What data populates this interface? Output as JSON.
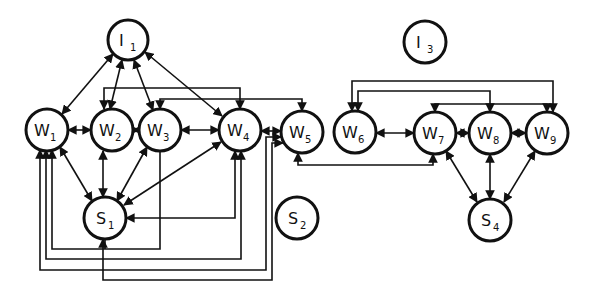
{
  "diagram": {
    "title": "",
    "colors": {
      "stroke": "#111111",
      "background": "#ffffff"
    },
    "nodes": [
      {
        "id": "I1",
        "letter": "I",
        "sub": "1",
        "x": 128,
        "y": 40,
        "r": 20
      },
      {
        "id": "W1",
        "letter": "W",
        "sub": "1",
        "x": 47,
        "y": 130,
        "r": 21
      },
      {
        "id": "W2",
        "letter": "W",
        "sub": "2",
        "x": 112,
        "y": 130,
        "r": 21
      },
      {
        "id": "W3",
        "letter": "W",
        "sub": "3",
        "x": 160,
        "y": 130,
        "r": 21
      },
      {
        "id": "W4",
        "letter": "W",
        "sub": "4",
        "x": 240,
        "y": 130,
        "r": 21
      },
      {
        "id": "W5",
        "letter": "W",
        "sub": "5",
        "x": 302,
        "y": 132,
        "r": 21
      },
      {
        "id": "S1",
        "letter": "S",
        "sub": "1",
        "x": 105,
        "y": 218,
        "r": 21
      },
      {
        "id": "S2",
        "letter": "S",
        "sub": "2",
        "x": 297,
        "y": 218,
        "r": 21
      },
      {
        "id": "I3",
        "letter": "I",
        "sub": "3",
        "x": 425,
        "y": 42,
        "r": 21
      },
      {
        "id": "W6",
        "letter": "W",
        "sub": "6",
        "x": 355,
        "y": 132,
        "r": 21
      },
      {
        "id": "W7",
        "letter": "W",
        "sub": "7",
        "x": 435,
        "y": 133,
        "r": 21
      },
      {
        "id": "W8",
        "letter": "W",
        "sub": "8",
        "x": 490,
        "y": 133,
        "r": 21
      },
      {
        "id": "W9",
        "letter": "W",
        "sub": "9",
        "x": 547,
        "y": 133,
        "r": 21
      },
      {
        "id": "S4",
        "letter": "S",
        "sub": "4",
        "x": 490,
        "y": 220,
        "r": 21
      }
    ],
    "edges": [
      {
        "from": "I1",
        "to": "W1",
        "type": "bidirectional"
      },
      {
        "from": "I1",
        "to": "W2",
        "type": "bidirectional"
      },
      {
        "from": "I1",
        "to": "W3",
        "type": "bidirectional"
      },
      {
        "from": "I1",
        "to": "W4",
        "type": "bidirectional"
      },
      {
        "from": "W1",
        "to": "W2",
        "type": "bidirectional"
      },
      {
        "from": "W2",
        "to": "W3",
        "type": "bidirectional"
      },
      {
        "from": "W3",
        "to": "W4",
        "type": "bidirectional"
      },
      {
        "from": "W4",
        "to": "W5",
        "type": "bidirectional"
      },
      {
        "from": "W1",
        "to": "S1",
        "type": "bidirectional"
      },
      {
        "from": "W2",
        "to": "S1",
        "type": "bidirectional"
      },
      {
        "from": "W3",
        "to": "S1",
        "type": "bidirectional"
      },
      {
        "from": "W4",
        "to": "S1",
        "type": "bidirectional"
      },
      {
        "from": "W2",
        "to": "W4",
        "type": "routed-top"
      },
      {
        "from": "W3",
        "to": "W5",
        "type": "routed-top"
      },
      {
        "from": "W4",
        "to": "S1",
        "type": "routed-side"
      },
      {
        "from": "W1",
        "to": "W3",
        "type": "routed-bottom"
      },
      {
        "from": "W1",
        "to": "W4",
        "type": "routed-bottom"
      },
      {
        "from": "W1",
        "to": "W5",
        "type": "routed-bottom"
      },
      {
        "from": "S1",
        "to": "W5",
        "type": "routed-bottom"
      },
      {
        "from": "W5",
        "to": "W7",
        "type": "routed-bottom"
      },
      {
        "from": "W6",
        "to": "W7",
        "type": "bidirectional"
      },
      {
        "from": "W7",
        "to": "W8",
        "type": "bidirectional"
      },
      {
        "from": "W8",
        "to": "W9",
        "type": "bidirectional"
      },
      {
        "from": "W7",
        "to": "S4",
        "type": "bidirectional"
      },
      {
        "from": "W8",
        "to": "S4",
        "type": "bidirectional"
      },
      {
        "from": "W9",
        "to": "S4",
        "type": "bidirectional"
      },
      {
        "from": "W6",
        "to": "W9",
        "type": "routed-top"
      },
      {
        "from": "W6",
        "to": "W8",
        "type": "routed-top"
      },
      {
        "from": "W7",
        "to": "W9",
        "type": "routed-top"
      }
    ]
  }
}
